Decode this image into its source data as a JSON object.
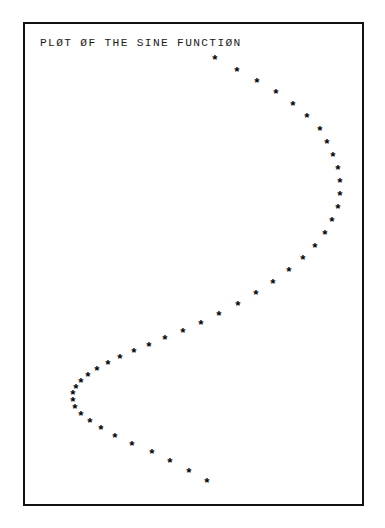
{
  "page": {
    "background_color": "#ffffff",
    "width": 385,
    "height": 528
  },
  "plot_frame": {
    "border_color": "#111111",
    "background_color": "#ffffff",
    "left": 23,
    "top": 22,
    "width": 341,
    "height": 484
  },
  "title": {
    "text": "PLØT ØF THE SINE FUNCTIØN",
    "color": "#1a1a1a"
  },
  "marker": {
    "glyph": "*",
    "color": "#000000",
    "name": "asterisk-marker"
  },
  "chart_data": {
    "type": "scatter",
    "title": "PLØT ØF THE SINE FUNCTIØN",
    "xlabel": "",
    "ylabel": "",
    "grid": false,
    "legend": null,
    "orientation": "vertical-parameter",
    "xlim": [
      -1,
      1
    ],
    "ylim": [
      0,
      6.2832
    ],
    "x_is": "sin(t)",
    "y_is": "t",
    "n_points": 45,
    "points_px": [
      [
        213,
        58
      ],
      [
        235,
        70
      ],
      [
        255,
        81
      ],
      [
        274,
        92
      ],
      [
        291,
        104
      ],
      [
        305,
        116
      ],
      [
        318,
        129
      ],
      [
        325,
        142
      ],
      [
        331,
        155
      ],
      [
        336,
        168
      ],
      [
        338,
        181
      ],
      [
        338,
        194
      ],
      [
        336,
        207
      ],
      [
        330,
        220
      ],
      [
        323,
        233
      ],
      [
        313,
        246
      ],
      [
        301,
        258
      ],
      [
        287,
        270
      ],
      [
        271,
        282
      ],
      [
        254,
        293
      ],
      [
        236,
        304
      ],
      [
        217,
        314
      ],
      [
        199,
        323
      ],
      [
        181,
        331
      ],
      [
        163,
        338
      ],
      [
        147,
        345
      ],
      [
        132,
        351
      ],
      [
        118,
        357
      ],
      [
        106,
        363
      ],
      [
        95,
        369
      ],
      [
        86,
        375
      ],
      [
        79,
        381
      ],
      [
        74,
        387
      ],
      [
        71,
        393
      ],
      [
        71,
        400
      ],
      [
        73,
        407
      ],
      [
        79,
        414
      ],
      [
        88,
        421
      ],
      [
        99,
        428
      ],
      [
        113,
        436
      ],
      [
        130,
        444
      ],
      [
        150,
        452
      ],
      [
        168,
        461
      ],
      [
        187,
        471
      ],
      [
        205,
        481
      ]
    ],
    "t_values": [
      0.0,
      0.143,
      0.286,
      0.429,
      0.571,
      0.714,
      0.857,
      1.0,
      1.143,
      1.286,
      1.428,
      1.571,
      1.714,
      1.857,
      2.0,
      2.142,
      2.285,
      2.428,
      2.571,
      2.714,
      2.856,
      2.999,
      3.142,
      3.285,
      3.427,
      3.57,
      3.713,
      3.856,
      3.999,
      4.141,
      4.284,
      4.427,
      4.57,
      4.712,
      4.855,
      4.998,
      5.141,
      5.284,
      5.426,
      5.569,
      5.712,
      5.855,
      5.998,
      6.14,
      6.283
    ],
    "sine_values": [
      0.0,
      0.142,
      0.282,
      0.416,
      0.541,
      0.655,
      0.756,
      0.841,
      0.91,
      0.96,
      0.99,
      1.0,
      0.99,
      0.96,
      0.91,
      0.841,
      0.756,
      0.655,
      0.541,
      0.416,
      0.282,
      0.142,
      0.0,
      -0.142,
      -0.282,
      -0.416,
      -0.541,
      -0.655,
      -0.756,
      -0.841,
      -0.91,
      -0.96,
      -0.99,
      -1.0,
      -0.99,
      -0.96,
      -0.91,
      -0.841,
      -0.756,
      -0.655,
      -0.541,
      -0.416,
      -0.282,
      -0.142,
      0.0
    ]
  }
}
